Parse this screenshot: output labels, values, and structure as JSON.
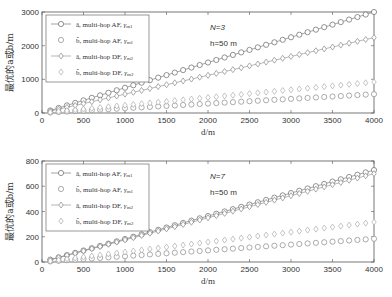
{
  "chart_data": [
    {
      "type": "scatter",
      "title": "",
      "annotations": [
        "N=3",
        "h=50 m"
      ],
      "xlabel": "d/m",
      "ylabel": "最优的a或b/m",
      "xlim": [
        0,
        4000
      ],
      "ylim": [
        0,
        3000
      ],
      "xticks": [
        0,
        500,
        1000,
        1500,
        2000,
        2500,
        3000,
        3500,
        4000
      ],
      "yticks": [
        0,
        1000,
        2000,
        3000
      ],
      "legend_position": "upper left",
      "x": [
        100,
        200,
        300,
        400,
        500,
        600,
        700,
        800,
        900,
        1000,
        1100,
        1200,
        1300,
        1400,
        1500,
        1600,
        1700,
        1800,
        1900,
        2000,
        2100,
        2200,
        2300,
        2400,
        2500,
        2600,
        2700,
        2800,
        2900,
        3000,
        3100,
        3200,
        3300,
        3400,
        3500,
        3600,
        3700,
        3800,
        3900,
        4000
      ],
      "series": [
        {
          "name": "â, multi-hop AF, γm1",
          "marker": "circle",
          "line": true,
          "slope": 0.75
        },
        {
          "name": "b̂, multi-hop AF, γm1",
          "marker": "circle",
          "line": false,
          "slope": 0.14
        },
        {
          "name": "â, multi-hop DF, γm2",
          "marker": "diamond",
          "line": true,
          "slope": 0.56
        },
        {
          "name": "b̂, multi-hop DF, γm2",
          "marker": "diamond",
          "line": false,
          "slope": 0.23
        }
      ]
    },
    {
      "type": "scatter",
      "title": "",
      "annotations": [
        "N=7",
        "h=50 m"
      ],
      "xlabel": "d/m",
      "ylabel": "最优的a或b/m",
      "xlim": [
        0,
        4000
      ],
      "ylim": [
        0,
        800
      ],
      "xticks": [
        0,
        500,
        1000,
        1500,
        2000,
        2500,
        3000,
        3500,
        4000
      ],
      "yticks": [
        0,
        200,
        400,
        600,
        800
      ],
      "legend_position": "upper left",
      "x": [
        100,
        200,
        300,
        400,
        500,
        600,
        700,
        800,
        900,
        1000,
        1100,
        1200,
        1300,
        1400,
        1500,
        1600,
        1700,
        1800,
        1900,
        2000,
        2100,
        2200,
        2300,
        2400,
        2500,
        2600,
        2700,
        2800,
        2900,
        3000,
        3100,
        3200,
        3300,
        3400,
        3500,
        3600,
        3700,
        3800,
        3900,
        4000
      ],
      "series": [
        {
          "name": "â, multi-hop AF, γm1",
          "marker": "circle",
          "line": true,
          "slope": 0.182
        },
        {
          "name": "b̂, multi-hop AF, γm1",
          "marker": "circle",
          "line": false,
          "slope": 0.046
        },
        {
          "name": "â, multi-hop DF, γm2",
          "marker": "diamond",
          "line": true,
          "slope": 0.175
        },
        {
          "name": "b̂, multi-hop DF, γm2",
          "marker": "diamond",
          "line": false,
          "slope": 0.079
        }
      ]
    }
  ],
  "legend": [
    {
      "label": "â, multi-hop AF, ",
      "sub": "γ",
      "subscript": "m1"
    },
    {
      "label": "b̂, multi-hop AF, ",
      "sub": "γ",
      "subscript": "m1"
    },
    {
      "label": "â, multi-hop DF, ",
      "sub": "γ",
      "subscript": "m2"
    },
    {
      "label": "b̂, multi-hop DF, ",
      "sub": "γ",
      "subscript": "m2"
    }
  ],
  "colors": {
    "axis": "#555555",
    "marker": "#777777",
    "marker_light": "#a0a0a0",
    "text": "#333333"
  }
}
